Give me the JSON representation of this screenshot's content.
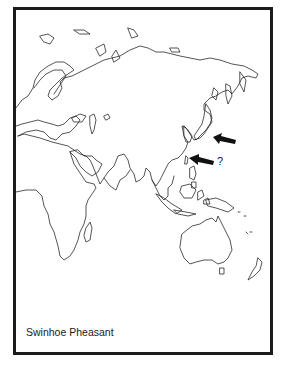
{
  "map": {
    "caption": "Swinhoe Pheasant",
    "region": "Eastern Hemisphere (Europe, Africa, Asia, Australia)",
    "markers": [
      {
        "type": "arrow",
        "points_to": "Japan / Korea region",
        "uncertain": false
      },
      {
        "type": "arrow",
        "points_to": "Taiwan",
        "uncertain": true,
        "label": "?"
      }
    ],
    "colors": {
      "border": "#1c1c1c",
      "coastline": "#2a2a2a",
      "arrow": "#111111",
      "background": "#ffffff"
    }
  }
}
